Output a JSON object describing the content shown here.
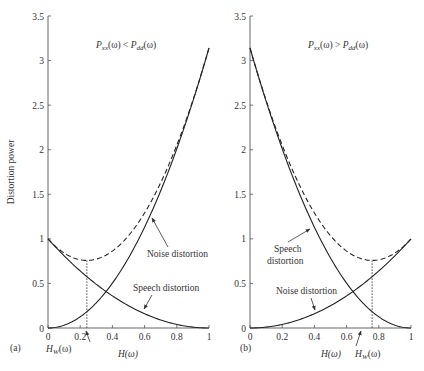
{
  "ylabel": "Distortion power",
  "panels": [
    {
      "id": "a",
      "tag": "(a)",
      "condition": {
        "P1": "P",
        "sub1": "xx",
        "mid": "(ω) < ",
        "P2": "P",
        "sub2": "dd",
        "end": "(ω)"
      },
      "xlabel": "H(ω)",
      "hw_label": {
        "H": "H",
        "sub": "W",
        "arg": "(ω)"
      },
      "noise_label": "Noise distortion",
      "speech_label": "Speech distortion"
    },
    {
      "id": "b",
      "tag": "(b)",
      "condition": {
        "P1": "P",
        "sub1": "xx",
        "mid": "(ω) > ",
        "P2": "P",
        "sub2": "dd",
        "end": "(ω)"
      },
      "xlabel": "H(ω)",
      "hw_label": {
        "H": "H",
        "sub": "W",
        "arg": "(ω)"
      },
      "noise_label": "Noise distortion",
      "speech_label_line1": "Speech",
      "speech_label_line2": "distortion"
    }
  ],
  "xticks": [
    "0",
    "0.2",
    "0.4",
    "0.6",
    "0.8",
    "1"
  ],
  "yticks": [
    "0",
    "0.5",
    "1",
    "1.5",
    "2",
    "2.5",
    "3",
    "3.5"
  ],
  "chart_data": [
    {
      "type": "line",
      "title": "P_xx(ω) < P_dd(ω)",
      "panel": "(a)",
      "xlabel": "H(ω)",
      "ylabel": "Distortion power",
      "xlim": [
        0,
        1
      ],
      "ylim": [
        0,
        3.5
      ],
      "x": [
        0,
        0.1,
        0.2,
        0.24,
        0.3,
        0.4,
        0.5,
        0.6,
        0.7,
        0.8,
        0.9,
        1.0
      ],
      "series": [
        {
          "name": "Noise distortion",
          "style": "solid",
          "values": [
            0,
            0.031,
            0.126,
            0.181,
            0.283,
            0.503,
            0.785,
            1.131,
            1.539,
            2.011,
            2.545,
            3.142
          ]
        },
        {
          "name": "Speech distortion",
          "style": "solid",
          "values": [
            1,
            0.81,
            0.64,
            0.578,
            0.49,
            0.36,
            0.25,
            0.16,
            0.09,
            0.04,
            0.01,
            0
          ]
        },
        {
          "name": "Total distortion",
          "style": "dashed",
          "values": [
            1,
            0.841,
            0.766,
            0.759,
            0.773,
            0.863,
            1.035,
            1.291,
            1.629,
            2.051,
            2.555,
            3.142
          ]
        }
      ],
      "annotations": [
        "Noise distortion",
        "Speech distortion",
        "H_W(ω) ≈ 0.24 (minimum of total, dotted line)"
      ],
      "grid": false
    },
    {
      "type": "line",
      "title": "P_xx(ω) > P_dd(ω)",
      "panel": "(b)",
      "xlabel": "H(ω)",
      "ylabel": "",
      "xlim": [
        0,
        1
      ],
      "ylim": [
        0,
        3.5
      ],
      "x": [
        0,
        0.1,
        0.2,
        0.3,
        0.4,
        0.5,
        0.6,
        0.7,
        0.76,
        0.8,
        0.9,
        1.0
      ],
      "series": [
        {
          "name": "Speech distortion",
          "style": "solid",
          "values": [
            3.142,
            2.545,
            2.011,
            1.539,
            1.131,
            0.785,
            0.503,
            0.283,
            0.181,
            0.126,
            0.031,
            0
          ]
        },
        {
          "name": "Noise distortion",
          "style": "solid",
          "values": [
            0,
            0.01,
            0.04,
            0.09,
            0.16,
            0.25,
            0.36,
            0.49,
            0.578,
            0.64,
            0.81,
            1
          ]
        },
        {
          "name": "Total distortion",
          "style": "dashed",
          "values": [
            3.142,
            2.555,
            2.051,
            1.629,
            1.291,
            1.035,
            0.863,
            0.773,
            0.759,
            0.766,
            0.841,
            1
          ]
        }
      ],
      "annotations": [
        "Speech distortion",
        "Noise distortion",
        "H_W(ω) ≈ 0.76 (minimum of total, dotted line)"
      ],
      "grid": false
    }
  ]
}
